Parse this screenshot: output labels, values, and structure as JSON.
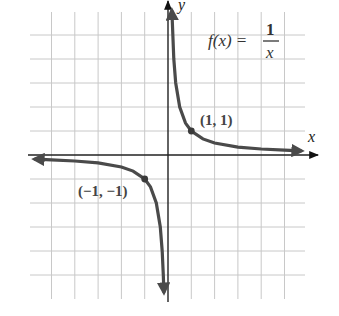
{
  "chart_data": {
    "type": "line",
    "function": {
      "name": "f(x)",
      "lhs": "f(x) =",
      "numerator": "1",
      "denominator": "x"
    },
    "xlabel": "x",
    "ylabel": "y",
    "xlim": [
      -6,
      6
    ],
    "ylim": [
      -6,
      6
    ],
    "grid": true,
    "grid_step": 1,
    "series": [
      {
        "name": "right branch",
        "x": [
          0.167,
          0.25,
          0.33,
          0.5,
          0.75,
          1,
          1.5,
          2,
          3,
          4,
          5,
          5.7
        ],
        "y": [
          6,
          4,
          3,
          2,
          1.33,
          1,
          0.67,
          0.5,
          0.33,
          0.25,
          0.2,
          0.175
        ]
      },
      {
        "name": "left branch",
        "x": [
          -5.7,
          -5,
          -4,
          -3,
          -2,
          -1.5,
          -1,
          -0.75,
          -0.5,
          -0.33,
          -0.25,
          -0.2,
          -0.176
        ],
        "y": [
          -0.175,
          -0.2,
          -0.25,
          -0.33,
          -0.5,
          -0.67,
          -1,
          -1.33,
          -2,
          -3,
          -4,
          -5,
          -5.7
        ]
      }
    ],
    "annotations": [
      {
        "text": "(1, 1)",
        "point": [
          1,
          1
        ]
      },
      {
        "text": "(−1, −1)",
        "point": [
          -1,
          -1
        ]
      }
    ],
    "legend": "none"
  },
  "labels": {
    "x_axis": "x",
    "y_axis": "y",
    "fn_lhs": "f(x) =",
    "fn_num": "1",
    "fn_den": "x",
    "point_pos": "(1, 1)",
    "point_neg": "(−1, −1)"
  }
}
